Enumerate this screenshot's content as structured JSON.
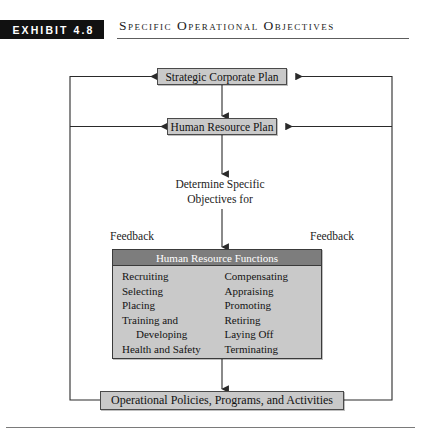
{
  "header": {
    "exhibit_tag": "EXHIBIT 4.8",
    "title": "Specific Operational Objectives"
  },
  "diagram": {
    "nodes": {
      "strategic_plan": "Strategic Corporate Plan",
      "hr_plan": "Human Resource Plan",
      "determine_line1": "Determine Specific",
      "determine_line2": "Objectives for",
      "operational": "Operational Policies, Programs, and Activities"
    },
    "feedback_left": "Feedback",
    "feedback_right": "Feedback",
    "hr_functions": {
      "header": "Human Resource Functions",
      "left_column": [
        {
          "label": "Recruiting",
          "indented": false
        },
        {
          "label": "Selecting",
          "indented": false
        },
        {
          "label": "Placing",
          "indented": false
        },
        {
          "label": "Training and",
          "indented": false
        },
        {
          "label": "Developing",
          "indented": true
        },
        {
          "label": "Health and Safety",
          "indented": false
        }
      ],
      "right_column": [
        {
          "label": "Compensating",
          "indented": false
        },
        {
          "label": "Appraising",
          "indented": false
        },
        {
          "label": "Promoting",
          "indented": false
        },
        {
          "label": "Retiring",
          "indented": false
        },
        {
          "label": "Laying Off",
          "indented": false
        },
        {
          "label": "Terminating",
          "indented": false
        }
      ]
    }
  },
  "colors": {
    "tag_background": "#111111",
    "box_fill": "#c9c9c9",
    "panel_header_fill": "#7d7d7d",
    "line": "#2a2a2a"
  }
}
